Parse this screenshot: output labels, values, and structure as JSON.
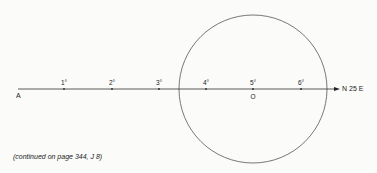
{
  "diagram": {
    "start_label": "A",
    "end_label": "N 25 E",
    "center_label": "O",
    "ticks": [
      {
        "label": "1°",
        "x": 64
      },
      {
        "label": "2°",
        "x": 112
      },
      {
        "label": "3°",
        "x": 159
      },
      {
        "label": "4°",
        "x": 206
      },
      {
        "label": "5°",
        "x": 253
      },
      {
        "label": "6°",
        "x": 301
      }
    ],
    "circle": {
      "cx": 253,
      "cy": 89,
      "r": 74
    },
    "line": {
      "x1": 18,
      "x2": 340,
      "y": 89
    }
  },
  "caption": "(continued on page 344, J 8)",
  "colors": {
    "line": "#333333",
    "circle": "#555555",
    "background": "#fbfbfa"
  }
}
